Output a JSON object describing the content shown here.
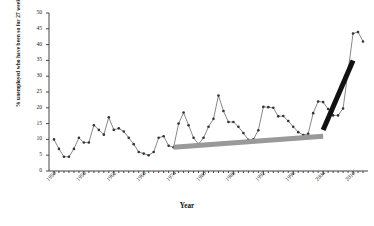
{
  "chart_data": {
    "type": "line",
    "title": "",
    "xlabel": "Year",
    "ylabel": "% unemployed who have been so for 27 weeks or more",
    "xlim": [
      1949,
      2013
    ],
    "ylim": [
      0,
      50
    ],
    "ytick_step": 5,
    "grid": false,
    "legend": "none",
    "marker": "circle",
    "line_color": "#555555",
    "marker_color": "#333333",
    "yticks": [
      0,
      5,
      10,
      15,
      20,
      25,
      30,
      35,
      40,
      45,
      50
    ],
    "xticks": [
      1950,
      1956,
      1962,
      1968,
      1974,
      1980,
      1986,
      1992,
      1998,
      2004,
      2010
    ],
    "series": [
      {
        "name": "Long-term unemployed share",
        "x": [
          1950,
          1951,
          1952,
          1953,
          1954,
          1955,
          1956,
          1957,
          1958,
          1959,
          1960,
          1961,
          1962,
          1963,
          1964,
          1965,
          1966,
          1967,
          1968,
          1969,
          1970,
          1971,
          1972,
          1973,
          1974,
          1975,
          1976,
          1977,
          1978,
          1979,
          1980,
          1981,
          1982,
          1983,
          1984,
          1985,
          1986,
          1987,
          1988,
          1989,
          1990,
          1991,
          1992,
          1993,
          1994,
          1995,
          1996,
          1997,
          1998,
          1999,
          2000,
          2001,
          2002,
          2003,
          2004,
          2005,
          2006,
          2007,
          2008,
          2009,
          2010,
          2011,
          2012
        ],
        "y": [
          10.0,
          7.0,
          4.5,
          4.5,
          7.0,
          10.5,
          9.0,
          9.0,
          14.5,
          13.0,
          11.5,
          17.0,
          13.0,
          13.5,
          12.5,
          10.5,
          8.5,
          6.0,
          5.5,
          5.0,
          6.0,
          10.5,
          11.0,
          8.0,
          7.5,
          15.0,
          18.5,
          14.5,
          10.5,
          8.5,
          10.5,
          14.0,
          16.5,
          23.9,
          19.0,
          15.5,
          15.5,
          14.0,
          12.0,
          9.9,
          10.0,
          12.9,
          20.3,
          20.2,
          20.0,
          17.3,
          17.4,
          15.8,
          14.0,
          12.3,
          11.4,
          11.8,
          18.3,
          22.0,
          21.8,
          19.6,
          17.6,
          17.6,
          19.8,
          31.5,
          43.5,
          44.0,
          41.0
        ]
      }
    ],
    "annotations": [
      {
        "name": "gray-trend-bar",
        "color": "#999999",
        "x_start": 1974,
        "y_start": 7.5,
        "x_end": 2004,
        "y_end": 11.0,
        "thickness_px": 5
      },
      {
        "name": "black-trend-bar",
        "color": "#111111",
        "x_start": 2004,
        "y_start": 13.0,
        "x_end": 2010,
        "y_end": 35.0,
        "thickness_px": 5
      }
    ]
  }
}
